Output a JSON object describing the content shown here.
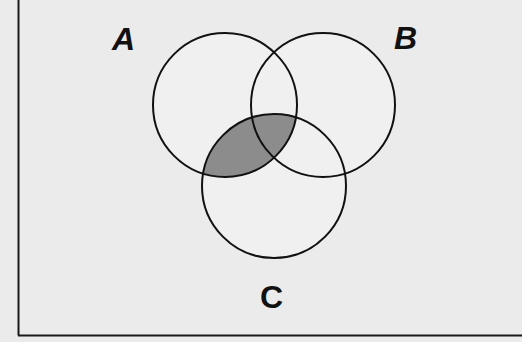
{
  "diagram": {
    "type": "venn-3",
    "sets": [
      {
        "id": "A",
        "label": "A",
        "cx": 225,
        "cy": 105,
        "r": 72
      },
      {
        "id": "B",
        "label": "B",
        "cx": 323,
        "cy": 105,
        "r": 72
      },
      {
        "id": "C",
        "label": "C",
        "cx": 274,
        "cy": 186,
        "r": 72
      }
    ],
    "shaded_region": "A ∩ C",
    "colors": {
      "background": "#ebebeb",
      "stroke": "#111111",
      "shade": "#8c8c8c",
      "circle_fill": "#efefef"
    }
  },
  "labels": {
    "a": "A",
    "b": "B",
    "c": "C"
  }
}
